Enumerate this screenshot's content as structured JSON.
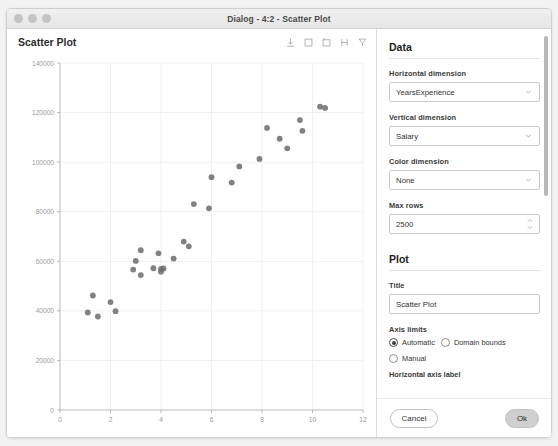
{
  "window": {
    "title": "Dialog - 4:2 - Scatter Plot",
    "traffic_lights": [
      "close-button",
      "minimize-button",
      "zoom-button"
    ]
  },
  "plot_panel": {
    "header_title": "Scatter Plot",
    "toolbar": [
      {
        "name": "export-icon",
        "label": "Export"
      },
      {
        "name": "rectangle-select-icon",
        "label": "Rectangle selection"
      },
      {
        "name": "lasso-select-icon",
        "label": "Lasso selection"
      },
      {
        "name": "zoom-select-icon",
        "label": "Zoom selection"
      },
      {
        "name": "reset-zoom-icon",
        "label": "Reset zoom"
      }
    ]
  },
  "settings": {
    "data_section": {
      "title": "Data",
      "horizontal_dimension": {
        "label": "Horizontal dimension",
        "value": "YearsExperience"
      },
      "vertical_dimension": {
        "label": "Vertical dimension",
        "value": "Salary"
      },
      "color_dimension": {
        "label": "Color dimension",
        "value": "None"
      },
      "max_rows": {
        "label": "Max rows",
        "value": "2500"
      }
    },
    "plot_section": {
      "title": "Plot",
      "title_field": {
        "label": "Title",
        "value": "Scatter Plot"
      },
      "axis_limits": {
        "label": "Axis limits",
        "options": [
          "Automatic",
          "Domain bounds",
          "Manual"
        ],
        "selected": "Automatic"
      },
      "horizontal_axis_label": {
        "label": "Horizontal axis label"
      }
    }
  },
  "footer": {
    "cancel_label": "Cancel",
    "ok_label": "Ok"
  },
  "colors": {
    "point": "#6b6b6b",
    "axis": "#b9b9b9",
    "grid": "#f1eef4",
    "tick_text": "#9a9a9a",
    "primary_button": "#cfcfcf"
  },
  "chart_data": {
    "type": "scatter",
    "title": "Scatter Plot",
    "xlabel": "",
    "ylabel": "",
    "xlim": [
      0,
      12
    ],
    "ylim": [
      0,
      140000
    ],
    "xticks": [
      0,
      2,
      4,
      6,
      8,
      10,
      12
    ],
    "yticks": [
      0,
      20000,
      40000,
      60000,
      80000,
      100000,
      120000,
      140000
    ],
    "grid": true,
    "legend": null,
    "series": [
      {
        "name": "Salary vs YearsExperience",
        "color": "#6b6b6b",
        "x": [
          1.1,
          1.3,
          1.5,
          2.0,
          2.2,
          2.9,
          3.0,
          3.2,
          3.2,
          3.7,
          3.9,
          4.0,
          4.0,
          4.1,
          4.5,
          4.9,
          5.1,
          5.3,
          5.9,
          6.0,
          6.8,
          7.1,
          7.9,
          8.2,
          8.7,
          9.0,
          9.5,
          9.6,
          10.3,
          10.5
        ],
        "y": [
          39343,
          46205,
          37731,
          43525,
          39891,
          56642,
          60150,
          54445,
          64445,
          57189,
          63218,
          55794,
          56957,
          57081,
          61111,
          67938,
          66029,
          83088,
          81363,
          93940,
          91738,
          98273,
          101302,
          113812,
          109431,
          105582,
          116969,
          112635,
          122391,
          121872
        ]
      }
    ]
  }
}
